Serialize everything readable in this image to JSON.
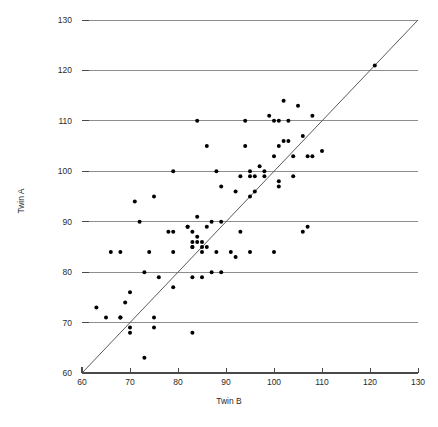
{
  "chart_data": {
    "type": "scatter",
    "title": "",
    "xlabel": "Twin B",
    "ylabel": "Twin A",
    "xlim": [
      60,
      130
    ],
    "ylim": [
      60,
      130
    ],
    "xticks": [
      60,
      70,
      80,
      90,
      100,
      110,
      120,
      130
    ],
    "yticks": [
      60,
      70,
      80,
      90,
      100,
      110,
      120,
      130
    ],
    "grid": "horizontal",
    "legend": "none",
    "annotations": [
      {
        "type": "reference-line",
        "description": "identity line y = x",
        "from": [
          60,
          60
        ],
        "to": [
          130,
          130
        ]
      }
    ],
    "marker": {
      "shape": "circle",
      "filled": true,
      "color": "#000000",
      "size_px": 4
    },
    "point_count": 88,
    "points": [
      [
        63,
        73
      ],
      [
        65,
        71
      ],
      [
        66,
        84
      ],
      [
        68,
        71
      ],
      [
        68,
        71
      ],
      [
        68,
        84
      ],
      [
        69,
        74
      ],
      [
        70,
        69
      ],
      [
        70,
        68
      ],
      [
        70,
        76
      ],
      [
        71,
        94
      ],
      [
        72,
        90
      ],
      [
        73,
        63
      ],
      [
        73,
        80
      ],
      [
        74,
        84
      ],
      [
        75,
        69
      ],
      [
        75,
        71
      ],
      [
        75,
        95
      ],
      [
        76,
        79
      ],
      [
        78,
        88
      ],
      [
        79,
        77
      ],
      [
        79,
        84
      ],
      [
        79,
        88
      ],
      [
        79,
        100
      ],
      [
        82,
        89
      ],
      [
        82,
        89
      ],
      [
        83,
        86
      ],
      [
        83,
        85
      ],
      [
        83,
        85
      ],
      [
        83,
        88
      ],
      [
        83,
        79
      ],
      [
        83,
        68
      ],
      [
        84,
        87
      ],
      [
        84,
        86
      ],
      [
        84,
        91
      ],
      [
        84,
        110
      ],
      [
        85,
        86
      ],
      [
        85,
        85
      ],
      [
        85,
        84
      ],
      [
        85,
        79
      ],
      [
        86,
        85
      ],
      [
        86,
        89
      ],
      [
        86,
        105
      ],
      [
        87,
        90
      ],
      [
        87,
        80
      ],
      [
        88,
        84
      ],
      [
        88,
        100
      ],
      [
        89,
        80
      ],
      [
        89,
        90
      ],
      [
        89,
        97
      ],
      [
        91,
        84
      ],
      [
        92,
        83
      ],
      [
        92,
        96
      ],
      [
        93,
        88
      ],
      [
        93,
        99
      ],
      [
        94,
        105
      ],
      [
        94,
        110
      ],
      [
        95,
        84
      ],
      [
        95,
        95
      ],
      [
        95,
        99
      ],
      [
        95,
        100
      ],
      [
        96,
        96
      ],
      [
        96,
        99
      ],
      [
        97,
        101
      ],
      [
        98,
        99
      ],
      [
        98,
        100
      ],
      [
        99,
        111
      ],
      [
        100,
        84
      ],
      [
        100,
        103
      ],
      [
        100,
        110
      ],
      [
        101,
        98
      ],
      [
        101,
        97
      ],
      [
        101,
        105
      ],
      [
        101,
        110
      ],
      [
        102,
        106
      ],
      [
        102,
        114
      ],
      [
        103,
        106
      ],
      [
        103,
        110
      ],
      [
        104,
        99
      ],
      [
        104,
        103
      ],
      [
        105,
        113
      ],
      [
        106,
        88
      ],
      [
        106,
        107
      ],
      [
        107,
        89
      ],
      [
        107,
        103
      ],
      [
        108,
        103
      ],
      [
        108,
        111
      ],
      [
        110,
        104
      ],
      [
        121,
        121
      ]
    ]
  },
  "axis": {
    "x_title": "Twin B",
    "y_title": "Twin A",
    "x_tick_labels": [
      "60",
      "70",
      "80",
      "90",
      "100",
      "110",
      "120",
      "130"
    ],
    "y_tick_labels": [
      "60",
      "70",
      "80",
      "90",
      "100",
      "110",
      "120",
      "130"
    ]
  },
  "colors": {
    "marker": "#000000",
    "gridline": "#8d8d8d",
    "axis": "#4a4a4a",
    "diagonal": "#5a5a5a",
    "background": "#ffffff"
  }
}
